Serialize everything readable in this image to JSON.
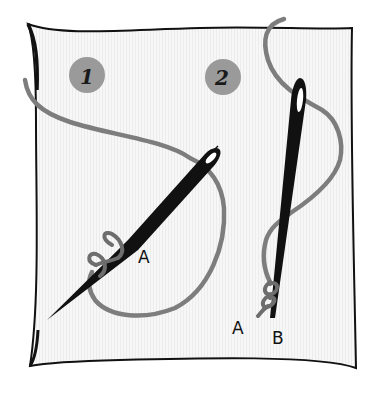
{
  "illustration": {
    "subject": "French knot embroidery steps",
    "colors": {
      "fabric_outline": "#111111",
      "fabric_fill": "#f4f4f4",
      "thread": "#7d7d7d",
      "needle": "#111111",
      "step_badge": "#9a9a9a"
    },
    "steps": [
      {
        "number": "1",
        "labels": [
          "A"
        ]
      },
      {
        "number": "2",
        "labels": [
          "A",
          "B"
        ]
      }
    ]
  }
}
